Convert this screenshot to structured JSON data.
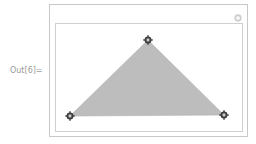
{
  "cell": {
    "label": "Out[6]="
  },
  "graphic": {
    "type": "Manipulate-Locator-Polygon",
    "fill_color": "#bdbdbd",
    "edge_color": "#a8a8a8",
    "frame_color": "#c8c8c8",
    "locators": [
      {
        "name": "top-vertex",
        "x": 148,
        "y": 40
      },
      {
        "name": "bottom-left-vertex",
        "x": 70,
        "y": 116
      },
      {
        "name": "bottom-right-vertex",
        "x": 224,
        "y": 115
      }
    ],
    "options_icon": "plus-circle-icon"
  }
}
